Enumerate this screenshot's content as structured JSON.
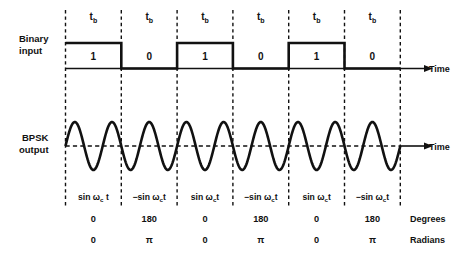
{
  "figure": {
    "background_color": "#ffffff",
    "ink_color": "#111111"
  },
  "labels": {
    "binary_input_line1": "Binary",
    "binary_input_line2": "input",
    "bpsk_output_line1": "BPSK",
    "bpsk_output_line2": "output",
    "time_axis_binary": "Time",
    "time_axis_bpsk": "Time",
    "degrees_label": "Degrees",
    "radians_label": "Radians",
    "bit_period_symbol": "t",
    "bit_period_subscript": "b"
  },
  "chart_data": {
    "type": "line",
    "xlabel": "Time",
    "ylabel": "",
    "grid": false,
    "legend": "none",
    "bit_period_label": "tb",
    "bit_count": 6,
    "cycles_per_bit": 1.5,
    "carrier_expression_phase0": "sin ωc t",
    "carrier_expression_phase180": "−sin ωc t",
    "bits": [
      {
        "index": 0,
        "value": "1",
        "level": "high",
        "carrier_prefix": "",
        "carrier_base": "sin ω",
        "carrier_sub": "c",
        "carrier_suffix": " t",
        "degrees": "0",
        "radians": "0",
        "phase_rad": 0
      },
      {
        "index": 1,
        "value": "0",
        "level": "low",
        "carrier_prefix": "−",
        "carrier_base": "sin ω",
        "carrier_sub": "c",
        "carrier_suffix": "t",
        "degrees": "180",
        "radians": "π",
        "phase_rad": 3.141592653589793
      },
      {
        "index": 2,
        "value": "1",
        "level": "high",
        "carrier_prefix": "",
        "carrier_base": "sin ω",
        "carrier_sub": "c",
        "carrier_suffix": "t",
        "degrees": "0",
        "radians": "0",
        "phase_rad": 0
      },
      {
        "index": 3,
        "value": "0",
        "level": "low",
        "carrier_prefix": "−",
        "carrier_base": "sin ω",
        "carrier_sub": "c",
        "carrier_suffix": "t",
        "degrees": "180",
        "radians": "π",
        "phase_rad": 3.141592653589793
      },
      {
        "index": 4,
        "value": "1",
        "level": "high",
        "carrier_prefix": "",
        "carrier_base": "sin ω",
        "carrier_sub": "c",
        "carrier_suffix": "t",
        "degrees": "0",
        "radians": "0",
        "phase_rad": 0
      },
      {
        "index": 5,
        "value": "0",
        "level": "low",
        "carrier_prefix": "−",
        "carrier_base": "sin ω",
        "carrier_sub": "c",
        "carrier_suffix": "t",
        "degrees": "180",
        "radians": "π",
        "phase_rad": 3.141592653589793
      }
    ]
  },
  "geometry": {
    "x_start": 65.5,
    "bit_width": 55.8,
    "binary_high_y": 43,
    "binary_base_y": 68.5,
    "binary_axis_end_x": 424,
    "bpsk_center_y": 146,
    "bpsk_amplitude": 24,
    "bpsk_axis_end_x": 424,
    "divider_top_y": 10,
    "divider_bottom_y": 208,
    "tb_label_y": 20,
    "bit_value_y": 60,
    "phase_label_y": 200,
    "degrees_row_y": 222,
    "radians_row_y": 243,
    "unit_label_x": 410
  }
}
